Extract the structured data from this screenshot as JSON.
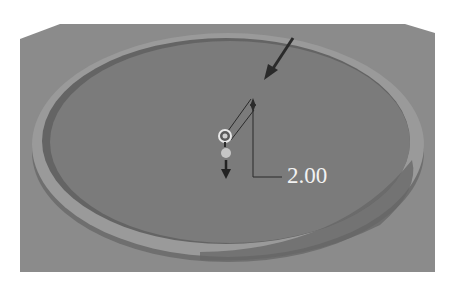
{
  "viewport": {
    "type": "3d-cad-viewport",
    "model": "circular-dish-with-rim",
    "colors": {
      "page_bg": "#ffffff",
      "panel_bg": "#8b8b8b",
      "dish_surface": "#7b7b7b",
      "rim_top": "#9a9a9a",
      "rim_wall_front": "#6c6c6c",
      "rim_wall_inner_shadow": "#626262",
      "annotation_line": "#2b2b2b",
      "dimension_text": "#f2f2f2"
    }
  },
  "annotations": {
    "pointer_arrow": "arrow-pointing-down-left",
    "drag_handle": "ring-handle",
    "anchor_point": "light-dot",
    "direction_arrow": "arrow-down",
    "dimension": {
      "value": "2.00"
    }
  }
}
